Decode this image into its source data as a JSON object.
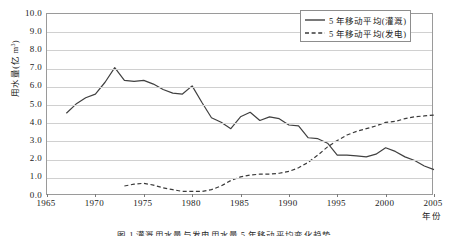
{
  "chart_data": {
    "type": "line",
    "title": "",
    "xlabel": "年份",
    "ylabel": "用水量(亿 m³)",
    "ylabel_main": "用水量(亿 m",
    "ylabel_sup": "3",
    "ylabel_tail": ")",
    "xlim": [
      1965,
      2005
    ],
    "ylim": [
      0.0,
      10.0
    ],
    "grid": true,
    "legend_position": "top-right",
    "ytick_labels": [
      "10.0",
      "9.0",
      "8.0",
      "7.0",
      "6.0",
      "5.0",
      "4.0",
      "3.0",
      "2.0",
      "1.0",
      "0.0"
    ],
    "ytick_values": [
      10,
      9,
      8,
      7,
      6,
      5,
      4,
      3,
      2,
      1,
      0
    ],
    "xtick_labels": [
      "1965",
      "1970",
      "1975",
      "1980",
      "1985",
      "1990",
      "1995",
      "2000",
      "2005"
    ],
    "xtick_values": [
      1965,
      1970,
      1975,
      1980,
      1985,
      1990,
      1995,
      2000,
      2005
    ],
    "series": [
      {
        "name": "5 年移动平均(灌溉)",
        "style": "solid",
        "color": "#404040",
        "x": [
          1967,
          1968,
          1969,
          1970,
          1971,
          1972,
          1973,
          1974,
          1975,
          1976,
          1977,
          1978,
          1979,
          1980,
          1981,
          1982,
          1983,
          1984,
          1985,
          1986,
          1987,
          1988,
          1989,
          1990,
          1991,
          1992,
          1993,
          1994,
          1995,
          1996,
          1997,
          1998,
          1999,
          2000,
          2001,
          2002,
          2003,
          2004,
          2005
        ],
        "values": [
          4.55,
          5.05,
          5.4,
          5.6,
          6.25,
          7.05,
          6.35,
          6.3,
          6.35,
          6.15,
          5.85,
          5.65,
          5.6,
          6.05,
          5.15,
          4.3,
          4.05,
          3.7,
          4.35,
          4.6,
          4.15,
          4.35,
          4.25,
          3.9,
          3.85,
          3.2,
          3.15,
          2.9,
          2.25,
          2.25,
          2.2,
          2.15,
          2.3,
          2.65,
          2.45,
          2.15,
          1.95,
          1.65,
          1.45
        ]
      },
      {
        "name": "5 年移动平均(发电)",
        "style": "dashed",
        "color": "#3a3a3a",
        "x": [
          1973,
          1974,
          1975,
          1976,
          1977,
          1978,
          1979,
          1980,
          1981,
          1982,
          1983,
          1984,
          1985,
          1986,
          1987,
          1988,
          1989,
          1990,
          1991,
          1992,
          1993,
          1994,
          1995,
          1996,
          1997,
          1998,
          1999,
          2000,
          2001,
          2002,
          2003,
          2004,
          2005
        ],
        "values": [
          0.55,
          0.65,
          0.7,
          0.6,
          0.45,
          0.35,
          0.25,
          0.25,
          0.25,
          0.35,
          0.55,
          0.85,
          1.05,
          1.15,
          1.2,
          1.2,
          1.25,
          1.35,
          1.55,
          1.85,
          2.25,
          2.7,
          3.05,
          3.35,
          3.55,
          3.7,
          3.85,
          4.05,
          4.1,
          4.25,
          4.35,
          4.4,
          4.45
        ]
      }
    ]
  },
  "legend": {
    "items": [
      {
        "label": "5 年移动平均(灌溉)",
        "style": "solid"
      },
      {
        "label": "5 年移动平均(发电)",
        "style": "dashed"
      }
    ]
  },
  "axis": {
    "x_title": "年份",
    "y_title_main": "用水量(亿 m",
    "y_title_sup": "3",
    "y_title_tail": ")"
  },
  "caption": {
    "text": "图 1  灌溉用水量与发电用水量 5 年移动平均变化趋势"
  }
}
